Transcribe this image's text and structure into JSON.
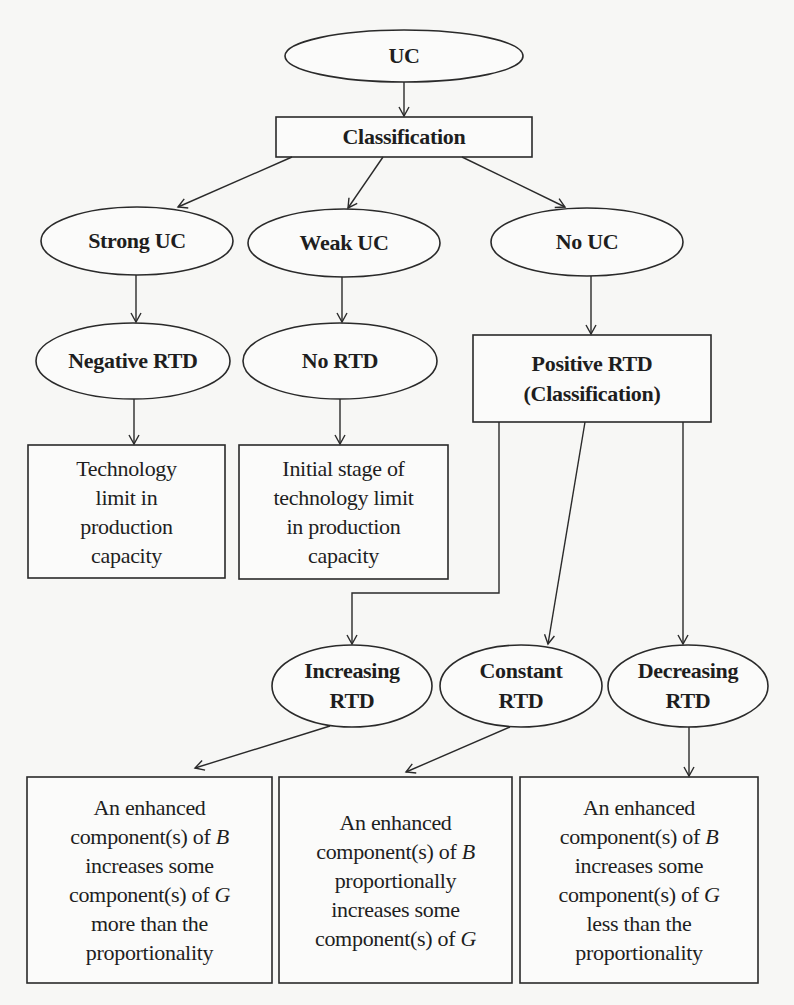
{
  "diagram": {
    "type": "flowchart",
    "nodes": {
      "uc": {
        "shape": "ellipse",
        "lines": [
          "UC"
        ]
      },
      "classification": {
        "shape": "rect",
        "lines": [
          "Classification"
        ]
      },
      "strong_uc": {
        "shape": "ellipse",
        "lines": [
          "Strong UC"
        ]
      },
      "weak_uc": {
        "shape": "ellipse",
        "lines": [
          "Weak UC"
        ]
      },
      "no_uc": {
        "shape": "ellipse",
        "lines": [
          "No UC"
        ]
      },
      "negative_rtd": {
        "shape": "ellipse",
        "lines": [
          "Negative RTD"
        ]
      },
      "no_rtd": {
        "shape": "ellipse",
        "lines": [
          "No RTD"
        ]
      },
      "positive_rtd": {
        "shape": "rect",
        "lines": [
          "Positive RTD",
          "(Classification)"
        ]
      },
      "technology_limit": {
        "shape": "rect",
        "lines": [
          "Technology",
          "limit in",
          "production",
          "capacity"
        ]
      },
      "initial_stage": {
        "shape": "rect",
        "lines": [
          "Initial stage of",
          "technology limit",
          "in production",
          "capacity"
        ]
      },
      "increasing_rtd": {
        "shape": "ellipse",
        "lines": [
          "Increasing",
          "RTD"
        ]
      },
      "constant_rtd": {
        "shape": "ellipse",
        "lines": [
          "Constant",
          "RTD"
        ]
      },
      "decreasing_rtd": {
        "shape": "ellipse",
        "lines": [
          "Decreasing",
          "RTD"
        ]
      },
      "increasing_desc": {
        "shape": "rect",
        "lines": [
          "An enhanced",
          "component(s) of ",
          "increases some",
          "component(s) of ",
          "more than the",
          "proportionality"
        ],
        "vars": {
          "b": "B",
          "g": "G"
        }
      },
      "constant_desc": {
        "shape": "rect",
        "lines": [
          "An enhanced",
          "component(s) of ",
          "proportionally",
          "increases some",
          "component(s) of "
        ],
        "vars": {
          "b": "B",
          "g": "G"
        }
      },
      "decreasing_desc": {
        "shape": "rect",
        "lines": [
          "An enhanced",
          "component(s) of ",
          "increases some",
          "component(s) of ",
          "less than the",
          "proportionality"
        ],
        "vars": {
          "b": "B",
          "g": "G"
        }
      }
    },
    "edges": [
      [
        "uc",
        "classification"
      ],
      [
        "classification",
        "strong_uc"
      ],
      [
        "classification",
        "weak_uc"
      ],
      [
        "classification",
        "no_uc"
      ],
      [
        "strong_uc",
        "negative_rtd"
      ],
      [
        "weak_uc",
        "no_rtd"
      ],
      [
        "no_uc",
        "positive_rtd"
      ],
      [
        "negative_rtd",
        "technology_limit"
      ],
      [
        "no_rtd",
        "initial_stage"
      ],
      [
        "positive_rtd",
        "increasing_rtd"
      ],
      [
        "positive_rtd",
        "constant_rtd"
      ],
      [
        "positive_rtd",
        "decreasing_rtd"
      ],
      [
        "increasing_rtd",
        "increasing_desc"
      ],
      [
        "constant_rtd",
        "constant_desc"
      ],
      [
        "decreasing_rtd",
        "decreasing_desc"
      ]
    ]
  }
}
